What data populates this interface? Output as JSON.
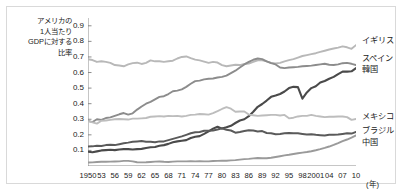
{
  "figure": {
    "y_axis_title": "アメリカの\n1人当たり\nGDPに対する\n比率",
    "x_unit_label": "(年)"
  },
  "chart_data": {
    "type": "line",
    "title": "",
    "subtitle": "",
    "xlabel": "(年)",
    "ylabel": "アメリカの1人当たりGDPに対する比率",
    "grid": false,
    "legend_position": "right-inline",
    "xlim": [
      1950,
      2010
    ],
    "ylim": [
      0,
      0.95
    ],
    "ytick_labels": [
      "0.9",
      "0.8",
      "0.7",
      "0.6",
      "0.5",
      "0.4",
      "0.3",
      "0.2",
      "0.1"
    ],
    "ytick_values": [
      0.9,
      0.8,
      0.7,
      0.6,
      0.5,
      0.4,
      0.3,
      0.2,
      0.1
    ],
    "xtick_labels": [
      "1950",
      "53",
      "56",
      "59",
      "62",
      "65",
      "68",
      "71",
      "74",
      "77",
      "80",
      "83",
      "86",
      "89",
      "92",
      "95",
      "98",
      "2001",
      "04",
      "07",
      "10"
    ],
    "xtick_values": [
      1950,
      1953,
      1956,
      1959,
      1962,
      1965,
      1968,
      1971,
      1974,
      1977,
      1980,
      1983,
      1986,
      1989,
      1992,
      1995,
      1998,
      2001,
      2004,
      2007,
      2010
    ],
    "x": [
      1950,
      1951,
      1952,
      1953,
      1954,
      1955,
      1956,
      1957,
      1958,
      1959,
      1960,
      1961,
      1962,
      1963,
      1964,
      1965,
      1966,
      1967,
      1968,
      1969,
      1970,
      1971,
      1972,
      1973,
      1974,
      1975,
      1976,
      1977,
      1978,
      1979,
      1980,
      1981,
      1982,
      1983,
      1984,
      1985,
      1986,
      1987,
      1988,
      1989,
      1990,
      1991,
      1992,
      1993,
      1994,
      1995,
      1996,
      1997,
      1998,
      1999,
      2000,
      2001,
      2002,
      2003,
      2004,
      2005,
      2006,
      2007,
      2008,
      2009,
      2010
    ],
    "series": [
      {
        "name": "イギリス",
        "color": "#b8b8b8",
        "width": 1.9,
        "label_x": 2011,
        "label_y": 0.8,
        "values": [
          0.685,
          0.68,
          0.668,
          0.672,
          0.668,
          0.662,
          0.648,
          0.645,
          0.64,
          0.652,
          0.66,
          0.663,
          0.655,
          0.662,
          0.678,
          0.672,
          0.672,
          0.668,
          0.672,
          0.676,
          0.69,
          0.7,
          0.703,
          0.692,
          0.683,
          0.678,
          0.67,
          0.662,
          0.668,
          0.664,
          0.648,
          0.64,
          0.645,
          0.65,
          0.648,
          0.655,
          0.658,
          0.668,
          0.678,
          0.678,
          0.672,
          0.662,
          0.658,
          0.662,
          0.672,
          0.68,
          0.686,
          0.696,
          0.706,
          0.712,
          0.718,
          0.724,
          0.732,
          0.74,
          0.748,
          0.754,
          0.76,
          0.768,
          0.762,
          0.752,
          0.776
        ]
      },
      {
        "name": "スペイン",
        "color": "#8c8c8c",
        "width": 1.9,
        "label_x": 2011,
        "label_y": 0.685,
        "values": [
          0.29,
          0.282,
          0.3,
          0.296,
          0.308,
          0.312,
          0.322,
          0.332,
          0.34,
          0.33,
          0.338,
          0.362,
          0.382,
          0.4,
          0.412,
          0.428,
          0.444,
          0.448,
          0.462,
          0.48,
          0.484,
          0.492,
          0.508,
          0.528,
          0.545,
          0.548,
          0.556,
          0.56,
          0.562,
          0.568,
          0.572,
          0.58,
          0.596,
          0.612,
          0.632,
          0.652,
          0.668,
          0.682,
          0.69,
          0.686,
          0.672,
          0.66,
          0.652,
          0.632,
          0.628,
          0.632,
          0.634,
          0.636,
          0.64,
          0.642,
          0.644,
          0.648,
          0.652,
          0.656,
          0.65,
          0.648,
          0.652,
          0.66,
          0.662,
          0.656,
          0.648
        ]
      },
      {
        "name": "韓国",
        "color": "#4a4a4a",
        "width": 2.1,
        "label_x": 2011,
        "label_y": 0.615,
        "values": [
          0.092,
          0.088,
          0.094,
          0.1,
          0.102,
          0.104,
          0.102,
          0.106,
          0.108,
          0.108,
          0.106,
          0.108,
          0.11,
          0.116,
          0.12,
          0.122,
          0.13,
          0.134,
          0.142,
          0.152,
          0.158,
          0.162,
          0.166,
          0.18,
          0.188,
          0.192,
          0.206,
          0.222,
          0.24,
          0.252,
          0.24,
          0.248,
          0.258,
          0.276,
          0.292,
          0.3,
          0.32,
          0.348,
          0.38,
          0.398,
          0.42,
          0.444,
          0.452,
          0.462,
          0.478,
          0.5,
          0.508,
          0.506,
          0.432,
          0.472,
          0.5,
          0.512,
          0.536,
          0.546,
          0.56,
          0.572,
          0.59,
          0.606,
          0.606,
          0.608,
          0.628
        ]
      },
      {
        "name": "メキシコ",
        "color": "#bdbdbd",
        "width": 1.9,
        "label_x": 2011,
        "label_y": 0.315,
        "values": [
          0.288,
          0.28,
          0.272,
          0.29,
          0.292,
          0.296,
          0.3,
          0.302,
          0.3,
          0.298,
          0.304,
          0.304,
          0.306,
          0.308,
          0.316,
          0.318,
          0.32,
          0.318,
          0.322,
          0.32,
          0.322,
          0.318,
          0.322,
          0.328,
          0.33,
          0.334,
          0.332,
          0.33,
          0.34,
          0.352,
          0.366,
          0.378,
          0.368,
          0.348,
          0.35,
          0.35,
          0.33,
          0.326,
          0.322,
          0.324,
          0.326,
          0.328,
          0.328,
          0.324,
          0.328,
          0.306,
          0.31,
          0.318,
          0.322,
          0.322,
          0.328,
          0.322,
          0.318,
          0.314,
          0.316,
          0.316,
          0.318,
          0.318,
          0.314,
          0.296,
          0.302
        ]
      },
      {
        "name": "ブラジル",
        "color": "#5a5a5a",
        "width": 2.0,
        "label_x": 2011,
        "label_y": 0.225,
        "values": [
          0.125,
          0.126,
          0.13,
          0.128,
          0.134,
          0.136,
          0.134,
          0.14,
          0.146,
          0.15,
          0.156,
          0.158,
          0.16,
          0.156,
          0.156,
          0.152,
          0.158,
          0.158,
          0.166,
          0.174,
          0.182,
          0.19,
          0.2,
          0.21,
          0.216,
          0.218,
          0.226,
          0.226,
          0.228,
          0.234,
          0.242,
          0.232,
          0.228,
          0.214,
          0.218,
          0.224,
          0.23,
          0.228,
          0.222,
          0.224,
          0.212,
          0.21,
          0.204,
          0.206,
          0.21,
          0.212,
          0.21,
          0.21,
          0.206,
          0.202,
          0.204,
          0.2,
          0.198,
          0.196,
          0.2,
          0.2,
          0.202,
          0.206,
          0.21,
          0.208,
          0.218
        ]
      },
      {
        "name": "中国",
        "color": "#9a9a9a",
        "width": 1.9,
        "label_x": 2011,
        "label_y": 0.145,
        "values": [
          0.022,
          0.023,
          0.026,
          0.027,
          0.027,
          0.028,
          0.029,
          0.03,
          0.033,
          0.033,
          0.03,
          0.024,
          0.023,
          0.024,
          0.026,
          0.028,
          0.029,
          0.027,
          0.026,
          0.028,
          0.03,
          0.03,
          0.03,
          0.031,
          0.03,
          0.031,
          0.03,
          0.03,
          0.032,
          0.033,
          0.034,
          0.034,
          0.036,
          0.038,
          0.041,
          0.044,
          0.046,
          0.049,
          0.051,
          0.05,
          0.05,
          0.053,
          0.058,
          0.063,
          0.068,
          0.072,
          0.077,
          0.082,
          0.086,
          0.09,
          0.095,
          0.101,
          0.108,
          0.116,
          0.125,
          0.135,
          0.147,
          0.16,
          0.17,
          0.182,
          0.196
        ]
      }
    ]
  }
}
